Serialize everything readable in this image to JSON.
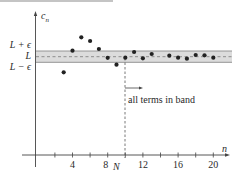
{
  "diagram": {
    "title_rule_color": "#b0b0b0",
    "y_axis_label": "c",
    "y_axis_label_sub": "n",
    "x_axis_label": "n",
    "band_labels": {
      "upper": "L + ϵ",
      "mid": "L",
      "lower": "L − ϵ"
    },
    "band_color": "#dcdcdc",
    "band_border_color": "#8a8a8a",
    "x_ticks": [
      {
        "n": 2,
        "label": ""
      },
      {
        "n": 4,
        "label": "4"
      },
      {
        "n": 6,
        "label": ""
      },
      {
        "n": 8,
        "label": "8"
      },
      {
        "n": 10,
        "label": ""
      },
      {
        "n": 12,
        "label": "12"
      },
      {
        "n": 14,
        "label": ""
      },
      {
        "n": 16,
        "label": "16"
      },
      {
        "n": 18,
        "label": ""
      },
      {
        "n": 20,
        "label": "20"
      }
    ],
    "N_label": "N",
    "N_position": 10,
    "annotation": "all terms in band",
    "points": [
      {
        "n": 3,
        "y": 72.3
      },
      {
        "n": 4,
        "y": 50.7
      },
      {
        "n": 5,
        "y": 37.3
      },
      {
        "n": 6,
        "y": 41
      },
      {
        "n": 7,
        "y": 49
      },
      {
        "n": 8,
        "y": 57.8
      },
      {
        "n": 9,
        "y": 64.7
      },
      {
        "n": 10,
        "y": 57.7
      },
      {
        "n": 11,
        "y": 52
      },
      {
        "n": 12,
        "y": 58.3
      },
      {
        "n": 13,
        "y": 54
      },
      {
        "n": 15,
        "y": 55.7
      },
      {
        "n": 16,
        "y": 57.7
      },
      {
        "n": 17,
        "y": 58.7
      },
      {
        "n": 18,
        "y": 55
      },
      {
        "n": 19,
        "y": 55.3
      },
      {
        "n": 20,
        "y": 57.7
      }
    ]
  }
}
